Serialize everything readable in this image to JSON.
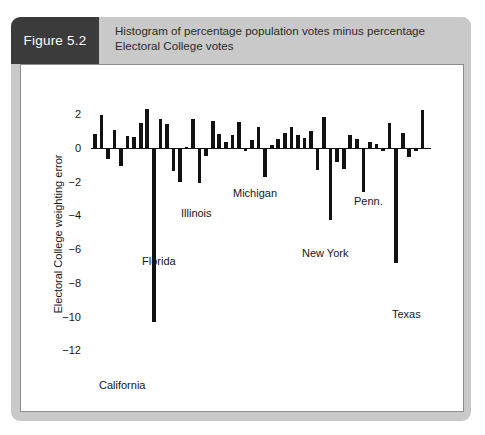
{
  "figure": {
    "tag": "Figure 5.2",
    "caption": "Histogram of percentage population votes minus percentage Electoral College votes",
    "tag_bg": "#3b3b3b",
    "header_bg": "#c9c9c9"
  },
  "chart_data": {
    "type": "bar",
    "title": "Histogram of percentage population votes minus percentage Electoral College votes",
    "xlabel": "",
    "ylabel": "Electoral College weighting error",
    "ylim": [
      -12,
      2.6
    ],
    "yticks": [
      2,
      0,
      -2,
      -4,
      -6,
      -8,
      -10,
      -12
    ],
    "ytick_labels": [
      "2",
      "0",
      "−2",
      "−4",
      "−6",
      "−8",
      "−10",
      "−12"
    ],
    "grid": false,
    "legend": false,
    "bar_color": "#111111",
    "categories": [
      "s01",
      "s02",
      "s03",
      "s04",
      "s05",
      "s06",
      "s07",
      "s08",
      "s09",
      "s10",
      "s11",
      "s12",
      "s13",
      "s14",
      "s15",
      "s16",
      "s17",
      "s18",
      "s19",
      "s20",
      "s21",
      "s22",
      "s23",
      "s24",
      "s25",
      "s26",
      "s27",
      "s28",
      "s29",
      "s30",
      "s31",
      "s32",
      "s33",
      "s34",
      "s35",
      "s36",
      "s37",
      "s38",
      "s39",
      "s40",
      "s41",
      "s42",
      "s43",
      "s44",
      "s45",
      "s46",
      "s47",
      "s48",
      "s49",
      "s50",
      "s51"
    ],
    "values": [
      0.85,
      1.95,
      -0.65,
      1.05,
      -1.05,
      0.7,
      0.65,
      1.5,
      2.3,
      -10.3,
      1.75,
      1.45,
      -1.35,
      -2.0,
      0.05,
      1.7,
      -2.1,
      -0.45,
      1.6,
      0.85,
      0.35,
      0.75,
      1.55,
      -0.2,
      0.45,
      1.25,
      -1.7,
      0.2,
      0.55,
      0.9,
      1.25,
      0.8,
      0.6,
      1.0,
      -1.3,
      1.85,
      -4.3,
      -0.85,
      -1.25,
      0.75,
      0.55,
      -2.6,
      0.35,
      0.25,
      -0.15,
      1.5,
      -6.8,
      0.9,
      -0.55,
      -0.2,
      2.25
    ],
    "annotations": [
      {
        "label": "California",
        "value": -10.3,
        "x": 88,
        "y": 362
      },
      {
        "label": "Florida",
        "value": -3.5,
        "x": 131,
        "y": 238
      },
      {
        "label": "Illinois",
        "value": -2.1,
        "x": 170,
        "y": 190
      },
      {
        "label": "Michigan",
        "value": -1.7,
        "x": 222,
        "y": 170
      },
      {
        "label": "New York",
        "value": -4.3,
        "x": 291,
        "y": 230
      },
      {
        "label": "Penn.",
        "value": -2.6,
        "x": 343,
        "y": 178
      },
      {
        "label": "Texas",
        "value": -6.8,
        "x": 381,
        "y": 291
      }
    ]
  }
}
